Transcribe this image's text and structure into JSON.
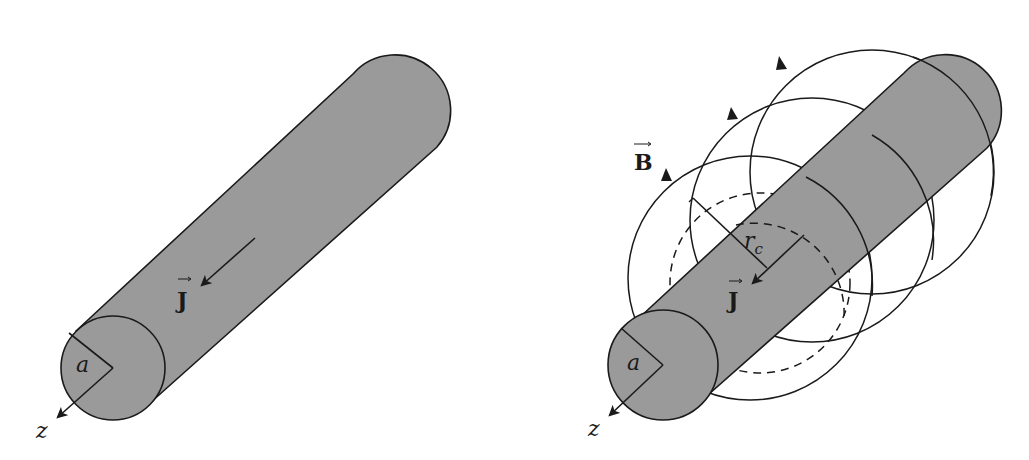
{
  "figure": {
    "left_panel": {
      "title": "Uniform current in cylindrical conductor",
      "labels": {
        "current_density": "J",
        "radius": "a",
        "axis": "z"
      }
    },
    "right_panel": {
      "title": "Magnetic field lines around conductor",
      "labels": {
        "magnetic_field": "B",
        "current_density": "J",
        "radius": "a",
        "contour_radius_main": "r",
        "contour_radius_sub": "c",
        "axis": "z"
      }
    },
    "colors": {
      "conductor_fill": "#9a9a9a",
      "stroke": "#1a1a1a",
      "background": "#ffffff"
    }
  }
}
